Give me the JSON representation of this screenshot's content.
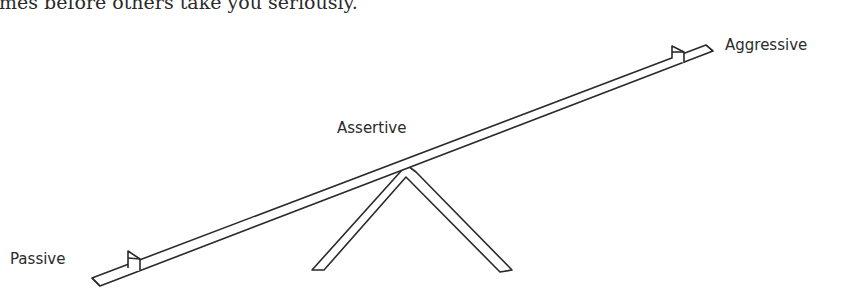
{
  "document": {
    "clipped_text": "mes before others take you seriously."
  },
  "diagram": {
    "type": "seesaw",
    "labels": {
      "left": "Passive",
      "center": "Assertive",
      "right": "Aggressive"
    },
    "colors": {
      "stroke": "#2a2a2a",
      "background": "#ffffff",
      "text": "#2b2b2b"
    }
  }
}
